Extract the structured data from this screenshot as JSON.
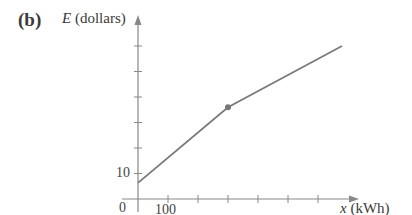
{
  "panel_label": "(b)",
  "chart_data": {
    "type": "line",
    "title": "",
    "panel": "(b)",
    "xlabel": "x (kWh)",
    "ylabel": "E (dollars)",
    "x_var": "x",
    "x_unit": "(kWh)",
    "y_var": "E",
    "y_unit": "(dollars)",
    "x_tick_labels": [
      {
        "value": 0,
        "label": "0"
      },
      {
        "value": 100,
        "label": "100"
      }
    ],
    "y_tick_labels": [
      {
        "value": 10,
        "label": "10"
      }
    ],
    "x_ticks": [
      100,
      200,
      300,
      400,
      500,
      600
    ],
    "y_ticks": [
      10,
      20,
      30,
      40,
      50,
      60
    ],
    "xlim": [
      0,
      720
    ],
    "ylim": [
      0,
      65
    ],
    "grid": false,
    "legend": null,
    "series": [
      {
        "name": "E(x)",
        "x": [
          0,
          300,
          680
        ],
        "y": [
          6.3,
          36,
          60
        ]
      }
    ],
    "annotations": [
      {
        "type": "point",
        "x": 300,
        "y": 36,
        "note": "breakpoint (filled dot)"
      }
    ]
  }
}
